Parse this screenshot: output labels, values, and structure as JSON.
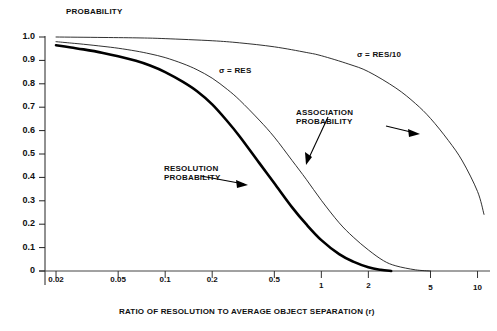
{
  "chart_data": {
    "type": "line",
    "title": "PROBABILITY",
    "xlabel": "RATIO OF RESOLUTION TO AVERAGE OBJECT SEPARATION (r)",
    "ylabel": "PROBABILITY",
    "xscale": "log",
    "yscale": "linear",
    "xlim": [
      0.017,
      11.5
    ],
    "ylim": [
      0,
      1.0
    ],
    "grid": false,
    "legend_position": "inline-annotations",
    "xticks": [
      0.02,
      0.05,
      0.1,
      0.2,
      0.5,
      1,
      2,
      5,
      10
    ],
    "xticklabels": [
      "0.02",
      "0.05",
      "0.1",
      "0.2",
      "0.5",
      "1",
      "2",
      "5",
      "10"
    ],
    "yticks": [
      0,
      0.1,
      0.2,
      0.3,
      0.4,
      0.5,
      0.6,
      0.7,
      0.8,
      0.9,
      1.0
    ],
    "yticklabels": [
      "0",
      "0.1",
      "0.2",
      "0.3",
      "0.4",
      "0.5",
      "0.6",
      "0.7",
      "0.8",
      "0.9",
      "1.0"
    ],
    "annotations": [
      {
        "name": "sigma-res",
        "text": "σ = RES"
      },
      {
        "name": "sigma-res-over-10",
        "text": "σ = RES/10"
      },
      {
        "name": "association-probability",
        "text": "ASSOCIATION\nPROBABILITY"
      },
      {
        "name": "resolution-probability",
        "text": "RESOLUTION\nPROBABILITY"
      }
    ],
    "series": [
      {
        "name": "Resolution Probability",
        "style": "bold",
        "color": "#000000",
        "x": [
          0.02,
          0.025,
          0.03,
          0.04,
          0.05,
          0.065,
          0.08,
          0.1,
          0.13,
          0.16,
          0.2,
          0.25,
          0.3,
          0.4,
          0.5,
          0.65,
          0.8,
          1.0,
          1.3,
          1.6,
          2.0,
          2.4,
          2.8
        ],
        "values": [
          0.965,
          0.955,
          0.947,
          0.932,
          0.918,
          0.898,
          0.878,
          0.85,
          0.808,
          0.768,
          0.712,
          0.64,
          0.575,
          0.462,
          0.375,
          0.272,
          0.2,
          0.132,
          0.072,
          0.04,
          0.016,
          0.005,
          0.0
        ]
      },
      {
        "name": "Association Probability (σ = RES)",
        "style": "thin",
        "color": "#1a1a1a",
        "x": [
          0.02,
          0.025,
          0.03,
          0.04,
          0.05,
          0.065,
          0.08,
          0.1,
          0.13,
          0.16,
          0.2,
          0.25,
          0.3,
          0.4,
          0.5,
          0.65,
          0.8,
          1.0,
          1.3,
          1.6,
          2.0,
          2.5,
          3.0,
          4.0,
          5.0
        ],
        "values": [
          0.98,
          0.974,
          0.969,
          0.96,
          0.952,
          0.94,
          0.928,
          0.912,
          0.886,
          0.86,
          0.824,
          0.776,
          0.73,
          0.645,
          0.572,
          0.472,
          0.392,
          0.302,
          0.206,
          0.145,
          0.09,
          0.044,
          0.022,
          0.005,
          0.0
        ]
      },
      {
        "name": "Association Probability (σ = RES/10)",
        "style": "thin",
        "color": "#1a1a1a",
        "x": [
          0.02,
          0.04,
          0.07,
          0.1,
          0.2,
          0.3,
          0.5,
          0.8,
          1.0,
          1.5,
          2.0,
          3.0,
          4.0,
          5.0,
          6.5,
          8.0,
          10.0,
          11.0
        ],
        "values": [
          1.0,
          0.998,
          0.996,
          0.993,
          0.984,
          0.975,
          0.958,
          0.934,
          0.92,
          0.884,
          0.852,
          0.782,
          0.716,
          0.652,
          0.558,
          0.47,
          0.34,
          0.242
        ]
      }
    ]
  },
  "axis": {
    "y_title": "PROBABILITY",
    "x_title": "RATIO OF RESOLUTION TO AVERAGE OBJECT SEPARATION (r)"
  }
}
